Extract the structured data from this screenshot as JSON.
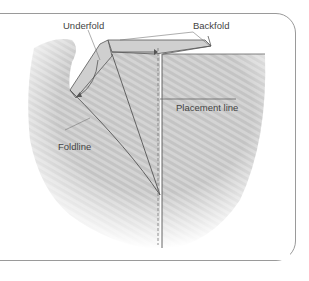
{
  "diagram": {
    "labels": {
      "underfold": "Underfold",
      "backfold": "Backfold",
      "placement_line": "Placement line",
      "foldline": "Foldline"
    },
    "colors": {
      "fabric": "#bdbdbd",
      "fabric_light": "#d6d6d6",
      "line": "#555555",
      "frame": "#9a9a9a"
    }
  }
}
